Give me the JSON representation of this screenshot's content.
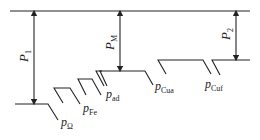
{
  "diagram": {
    "type": "power-flow",
    "colors": {
      "line": "#222222",
      "background": "#ffffff"
    },
    "labels": {
      "P1": {
        "main": "P",
        "sub": "1"
      },
      "PM": {
        "main": "P",
        "sub": "M"
      },
      "P2": {
        "main": "P",
        "sub": "2"
      },
      "p_omega": {
        "main": "p",
        "sub": "Ω"
      },
      "p_fe": {
        "main": "p",
        "sub": "Fe"
      },
      "p_ad": {
        "main": "p",
        "sub": "ad"
      },
      "p_cua": {
        "main": "p",
        "sub": "Cua"
      },
      "p_cuf": {
        "main": "p",
        "sub": "Cuf"
      }
    }
  }
}
